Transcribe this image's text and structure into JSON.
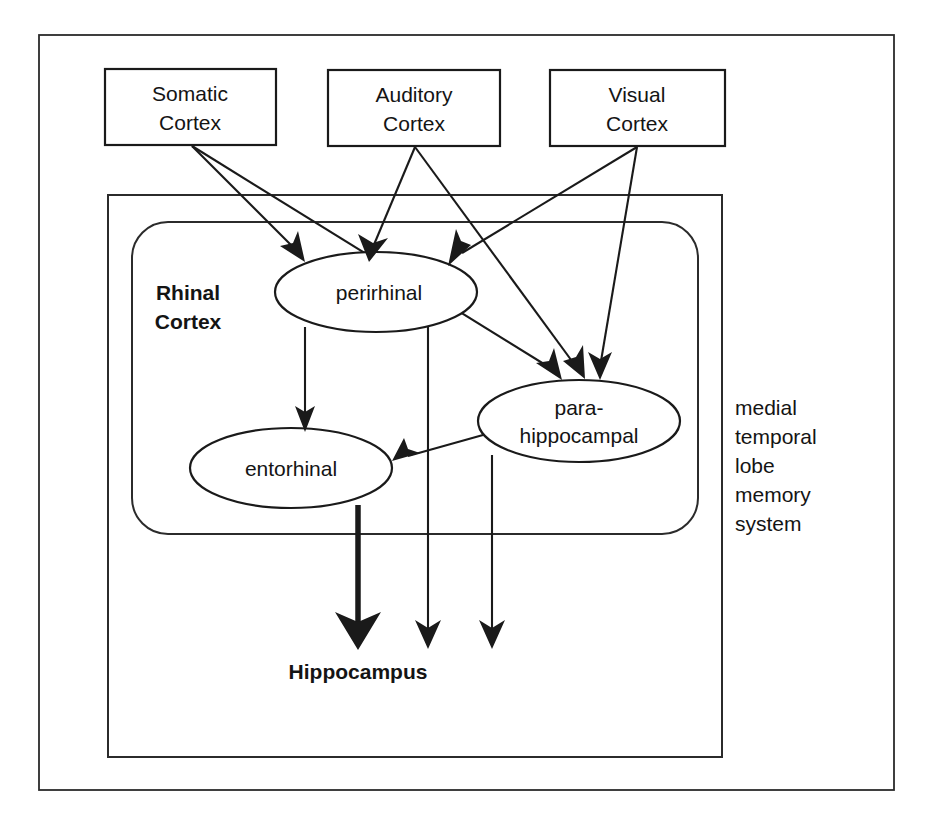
{
  "figure": {
    "background_color": "#ffffff",
    "line_color": "#1a1a1a",
    "width": 932,
    "height": 820
  },
  "cortex_boxes": [
    {
      "id": "somatic",
      "line1": "Somatic",
      "line2": "Cortex"
    },
    {
      "id": "auditory",
      "line1": "Auditory",
      "line2": "Cortex"
    },
    {
      "id": "visual",
      "line1": "Visual",
      "line2": "Cortex"
    }
  ],
  "regions": {
    "rhinal_cortex": {
      "line1": "Rhinal",
      "line2": "Cortex"
    },
    "mtl_side_label": {
      "lines": [
        "medial",
        "temporal",
        "lobe",
        "memory",
        "system"
      ]
    }
  },
  "ellipses": [
    {
      "id": "perirhinal",
      "line1": "perirhinal",
      "line2": ""
    },
    {
      "id": "entorhinal",
      "line1": "entorhinal",
      "line2": ""
    },
    {
      "id": "parahippocampal",
      "line1": "para-",
      "line2": "hippocampal"
    }
  ],
  "targets": {
    "hippocampus": "Hippocampus"
  },
  "connections": [
    {
      "from": "somatic",
      "to": "perirhinal"
    },
    {
      "from": "somatic",
      "to": "parahippocampal"
    },
    {
      "from": "auditory",
      "to": "perirhinal"
    },
    {
      "from": "auditory",
      "to": "parahippocampal"
    },
    {
      "from": "visual",
      "to": "perirhinal"
    },
    {
      "from": "visual",
      "to": "parahippocampal"
    },
    {
      "from": "perirhinal",
      "to": "entorhinal"
    },
    {
      "from": "parahippocampal",
      "to": "entorhinal"
    },
    {
      "from": "entorhinal",
      "to": "hippocampus"
    },
    {
      "from": "perirhinal",
      "to": "hippocampus"
    },
    {
      "from": "parahippocampal",
      "to": "hippocampus"
    }
  ],
  "caption": {
    "text": ""
  }
}
